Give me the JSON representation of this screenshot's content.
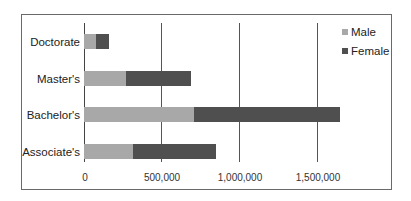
{
  "chart_data": {
    "type": "bar",
    "orientation": "horizontal",
    "stacked": true,
    "title": "",
    "xlabel": "",
    "ylabel": "",
    "categories": [
      "Doctorate",
      "Master's",
      "Bachelor's",
      "Associate's"
    ],
    "series": [
      {
        "name": "Male",
        "color": "#a8a8a8",
        "values": [
          77000,
          272000,
          707000,
          316000
        ]
      },
      {
        "name": "Female",
        "color": "#4f4f4f",
        "values": [
          83000,
          418000,
          940000,
          534000
        ]
      }
    ],
    "xlim": [
      0,
      1750000
    ],
    "xticks": [
      0,
      500000,
      1000000,
      1500000
    ],
    "xtick_labels": [
      "0",
      "500,000",
      "1,000,000",
      "1,500,000"
    ],
    "grid": "vertical",
    "legend_position": "upper-right"
  },
  "legend": {
    "items": [
      {
        "label": "Male",
        "color": "#a8a8a8"
      },
      {
        "label": "Female",
        "color": "#4f4f4f"
      }
    ]
  },
  "axis": {
    "ticks": [
      "0",
      "500,000",
      "1,000,000",
      "1,500,000"
    ]
  },
  "categories": [
    "Doctorate",
    "Master's",
    "Bachelor's",
    "Associate's"
  ]
}
